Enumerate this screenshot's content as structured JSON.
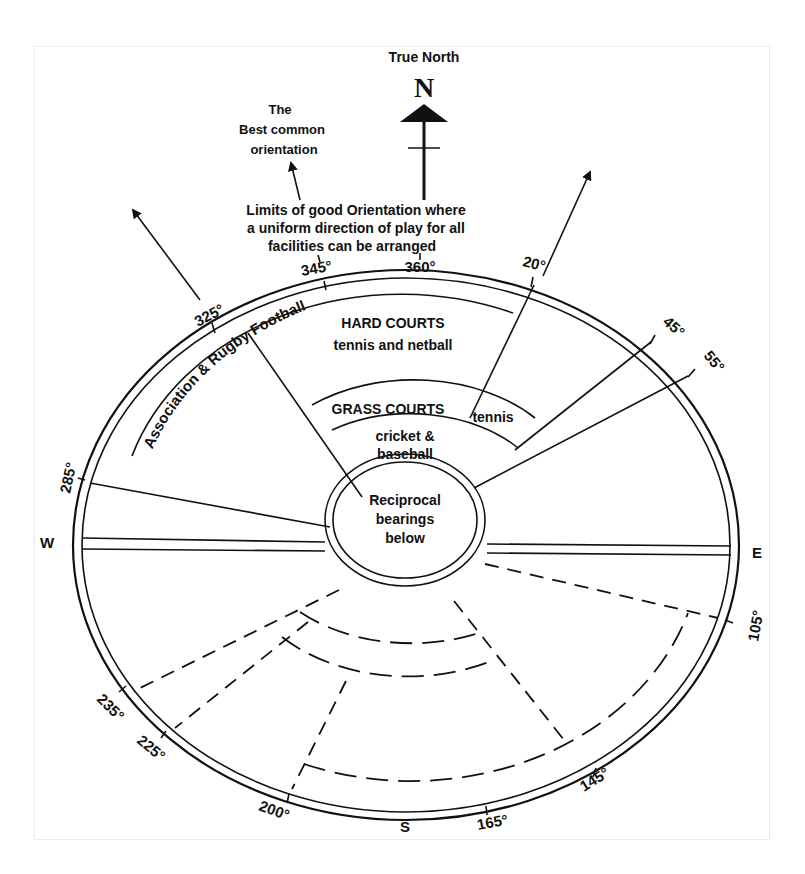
{
  "title": "True North",
  "north_symbol": "N",
  "annotations": {
    "best_common": [
      "The",
      "Best common",
      "orientation"
    ],
    "limits": [
      "Limits of good Orientation where",
      "a uniform direction of play for all",
      "facilities can be arranged"
    ]
  },
  "zones": {
    "football": "Association & Rugby Football",
    "hard_courts_title": "HARD COURTS",
    "hard_courts_sub": "tennis and netball",
    "grass_courts_title": "GRASS COURTS",
    "grass_courts_sub": "tennis",
    "cricket_line1": "cricket &",
    "cricket_line2": "baseball",
    "center_line1": "Reciprocal",
    "center_line2": "bearings",
    "center_line3": "below"
  },
  "cardinals": {
    "west": "W",
    "east": "E",
    "south": "S"
  },
  "bearings": {
    "b325": "325°",
    "b345": "345°",
    "b360": "360°",
    "b20": "20°",
    "b45": "45°",
    "b55": "55°",
    "b285": "285°",
    "b105": "105°",
    "b145": "145°",
    "b165": "165°",
    "b200": "200°",
    "b225": "225°",
    "b235": "235°"
  },
  "colors": {
    "ink": "#111111",
    "background": "#ffffff"
  }
}
